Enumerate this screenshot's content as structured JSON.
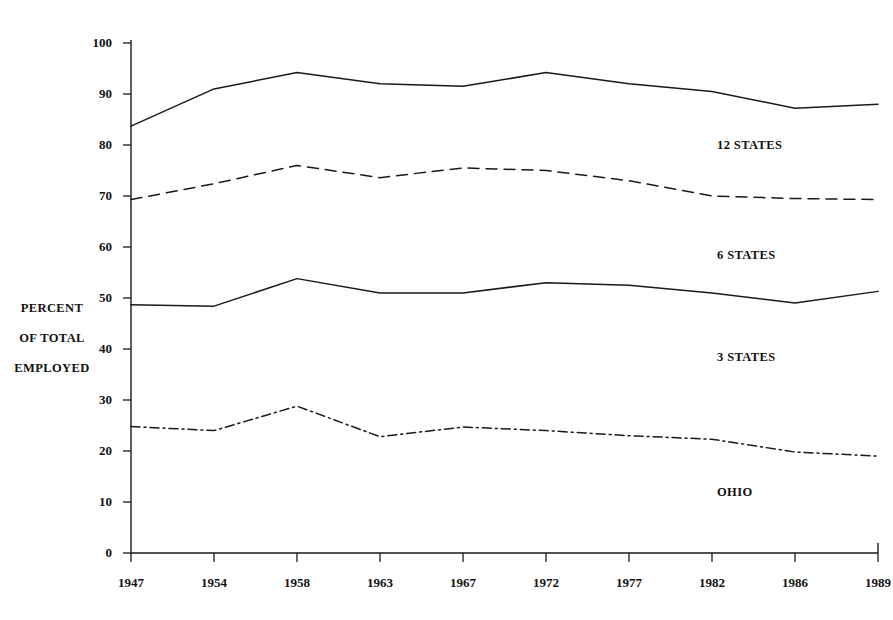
{
  "chart_data": {
    "type": "line",
    "title": "",
    "subtitle": "",
    "xlabel": "",
    "ylabel": "PERCENT OF TOTAL EMPLOYED",
    "ylabel_lines": [
      "PERCENT",
      "OF TOTAL",
      "EMPLOYED"
    ],
    "categories": [
      "1947",
      "1954",
      "1958",
      "1963",
      "1967",
      "1972",
      "1977",
      "1982",
      "1986",
      "1989"
    ],
    "x": [
      1947,
      1954,
      1958,
      1963,
      1967,
      1972,
      1977,
      1982,
      1986,
      1989
    ],
    "ylim": [
      0,
      100
    ],
    "y_ticks": [
      0,
      10,
      20,
      30,
      40,
      50,
      60,
      70,
      80,
      90,
      100
    ],
    "y_tick_labels": [
      "0",
      "10",
      "20",
      "30",
      "40",
      "50",
      "60",
      "70",
      "80",
      "90",
      "100"
    ],
    "grid": false,
    "legend": "inline-right-of-series",
    "series": [
      {
        "name": "12 STATES",
        "style": "solid",
        "color": "#1a1a1a",
        "values": [
          83.7,
          91.0,
          94.2,
          92.0,
          91.5,
          94.2,
          92.0,
          90.5,
          87.2,
          88.0
        ],
        "label_value": 80.0
      },
      {
        "name": "6 STATES",
        "style": "dashed",
        "color": "#1a1a1a",
        "values": [
          69.3,
          72.4,
          76.0,
          73.6,
          75.5,
          75.0,
          73.0,
          70.0,
          69.5,
          69.3
        ],
        "label_value": 58.5
      },
      {
        "name": "3 STATES",
        "style": "solid",
        "color": "#1a1a1a",
        "values": [
          48.7,
          48.4,
          53.8,
          51.0,
          51.0,
          53.0,
          52.5,
          51.0,
          49.0,
          51.3
        ],
        "label_value": 38.5
      },
      {
        "name": "OHIO",
        "style": "dashdot",
        "color": "#1a1a1a",
        "values": [
          24.8,
          24.0,
          28.8,
          22.8,
          24.7,
          24.0,
          23.0,
          22.3,
          19.8,
          19.0
        ],
        "label_value": 12.0
      }
    ]
  },
  "axes": {
    "y_axis_name": "percent-axis",
    "x_axis_name": "year-axis"
  }
}
